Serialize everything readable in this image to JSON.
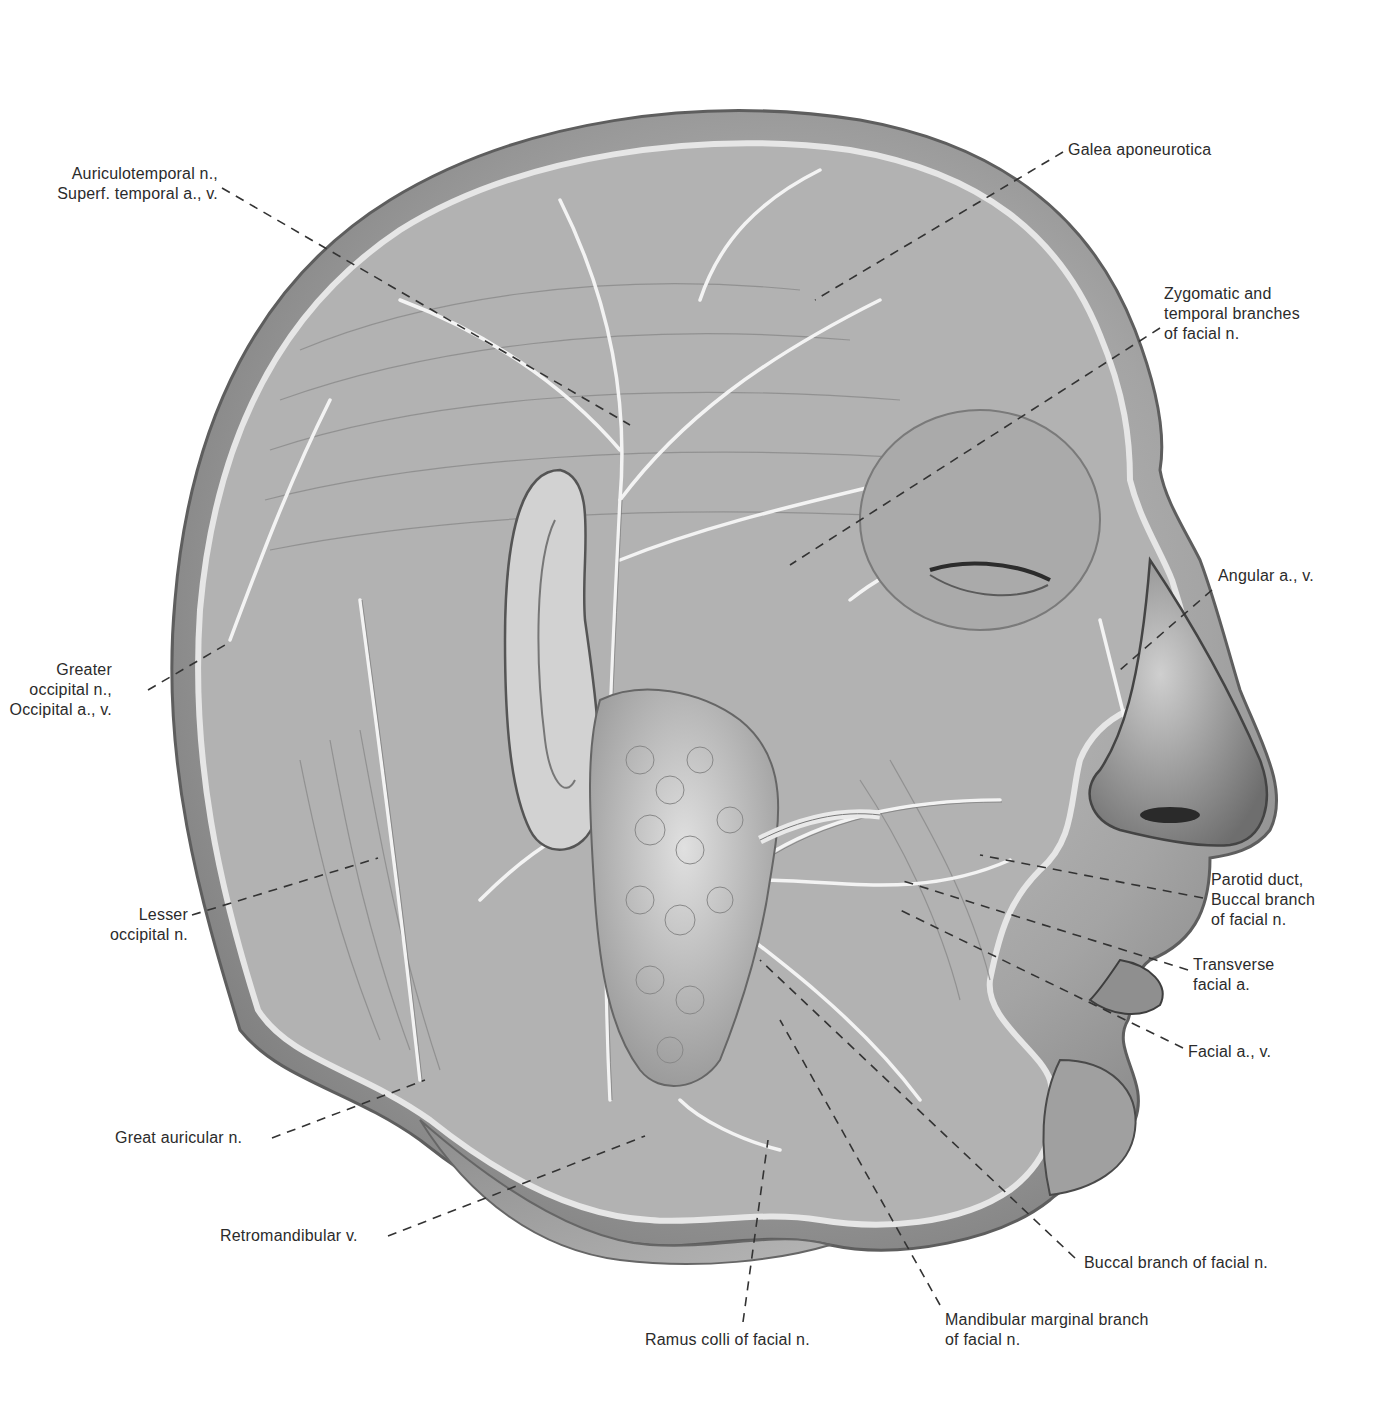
{
  "figure": {
    "colors": {
      "background": "#ffffff",
      "skin_dark": "#5a5a5a",
      "skin_mid": "#9a9a9a",
      "skin_light": "#d8d8d8",
      "scalp_rim": "#bdbdbd",
      "vessel": "#f2f2f2",
      "label_text": "#2b2b2b",
      "leader_line": "#333333"
    }
  },
  "labels": [
    {
      "id": "auriculotemporal",
      "lines": [
        "Auriculotemporal n.,",
        "Superf. temporal a., v."
      ],
      "side": "left"
    },
    {
      "id": "greater-occipital",
      "lines": [
        "Greater",
        "occipital n.,",
        "Occipital a., v."
      ],
      "side": "left"
    },
    {
      "id": "lesser-occipital",
      "lines": [
        "Lesser",
        "occipital n."
      ],
      "side": "left"
    },
    {
      "id": "great-auricular",
      "lines": [
        "Great auricular n."
      ],
      "side": "left"
    },
    {
      "id": "retromandibular",
      "lines": [
        "Retromandibular v."
      ],
      "side": "left"
    },
    {
      "id": "ramus-colli",
      "lines": [
        "Ramus colli of facial n."
      ],
      "side": "bottom"
    },
    {
      "id": "mandibular-marginal",
      "lines": [
        "Mandibular marginal branch",
        "of facial n."
      ],
      "side": "bottom"
    },
    {
      "id": "buccal-branch",
      "lines": [
        "Buccal branch of facial n."
      ],
      "side": "right"
    },
    {
      "id": "facial-av",
      "lines": [
        "Facial a., v."
      ],
      "side": "right"
    },
    {
      "id": "transverse-facial",
      "lines": [
        "Transverse",
        "facial a."
      ],
      "side": "right"
    },
    {
      "id": "parotid-duct",
      "lines": [
        "Parotid duct,",
        "Buccal branch",
        "of facial n."
      ],
      "side": "right"
    },
    {
      "id": "angular",
      "lines": [
        "Angular a., v."
      ],
      "side": "right"
    },
    {
      "id": "zygomatic-temporal",
      "lines": [
        "Zygomatic and",
        "temporal branches",
        "of facial n."
      ],
      "side": "right"
    },
    {
      "id": "galea",
      "lines": [
        "Galea aponeurotica"
      ],
      "side": "top"
    }
  ]
}
